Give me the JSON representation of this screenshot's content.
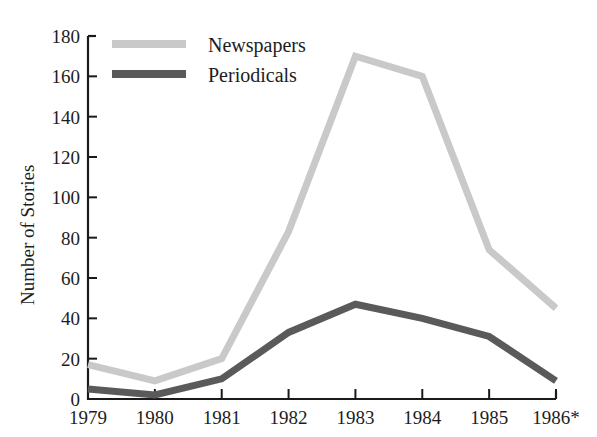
{
  "chart_data": {
    "type": "line",
    "title": "",
    "subtitle": "",
    "xlabel": "",
    "ylabel": "Number of Stories",
    "categories": [
      "1979",
      "1980",
      "1981",
      "1982",
      "1983",
      "1984",
      "1985",
      "1986*"
    ],
    "x": [
      1979,
      1980,
      1981,
      1982,
      1983,
      1984,
      1985,
      1986
    ],
    "series": [
      {
        "name": "Newspapers",
        "color": "#c9c9c9",
        "values": [
          17,
          9,
          20,
          83,
          170,
          160,
          74,
          45
        ]
      },
      {
        "name": "Periodicals",
        "color": "#5a5a5a",
        "values": [
          5,
          2,
          10,
          33,
          47,
          40,
          31,
          9
        ]
      }
    ],
    "ylim": [
      0,
      180
    ],
    "ytick_values": [
      0,
      20,
      40,
      60,
      80,
      100,
      120,
      140,
      160,
      180
    ],
    "ytick_labels": [
      "0",
      "20",
      "40",
      "60",
      "80",
      "100",
      "120",
      "140",
      "160",
      "180"
    ],
    "grid": false,
    "legend_position": "top-left-inside",
    "annotations": [
      "* denotes partial or projected year"
    ]
  },
  "legend": {
    "items": [
      {
        "label": "Newspapers",
        "color": "#c9c9c9"
      },
      {
        "label": "Periodicals",
        "color": "#5a5a5a"
      }
    ]
  },
  "axes": {
    "y_title": "Number of Stories"
  }
}
